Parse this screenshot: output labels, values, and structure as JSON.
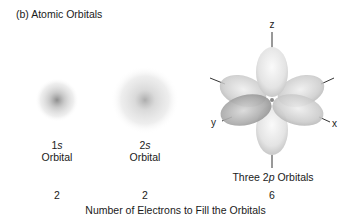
{
  "title": "(b) Atomic Orbitals",
  "orbitals": [
    {
      "name_prefix": "1",
      "name_sub": "s",
      "name_suffix": "",
      "line2": "Orbital",
      "electrons": "2"
    },
    {
      "name_prefix": "2",
      "name_sub": "s",
      "name_suffix": "",
      "line2": "Orbital",
      "electrons": "2"
    },
    {
      "name_prefix": "Three 2",
      "name_sub": "p",
      "name_suffix": " Orbitals",
      "line2": "",
      "electrons": "6"
    }
  ],
  "axes": {
    "z": "z",
    "y": "y",
    "x": "x"
  },
  "footer": "Number of Electrons to Fill the Orbitals"
}
